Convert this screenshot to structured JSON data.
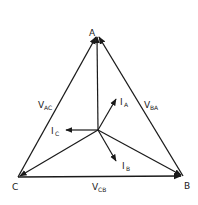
{
  "diagram": {
    "type": "phasor-diagram",
    "colors": {
      "stroke": "#1a1a1a",
      "background": "#ffffff"
    },
    "vertices": [
      {
        "id": "A",
        "label": "A",
        "x": 97,
        "y": 35
      },
      {
        "id": "B",
        "label": "B",
        "x": 183,
        "y": 176
      },
      {
        "id": "C",
        "label": "C",
        "x": 18,
        "y": 177
      }
    ],
    "neutral": {
      "x": 98,
      "y": 130
    },
    "voltages": [
      {
        "id": "VAC",
        "main": "V",
        "sub": "AC",
        "from": "C",
        "to": "A"
      },
      {
        "id": "VBA",
        "main": "V",
        "sub": "BA",
        "from": "B",
        "to": "A"
      },
      {
        "id": "VCB",
        "main": "V",
        "sub": "CB",
        "from": "C",
        "to": "B"
      }
    ],
    "currents": [
      {
        "id": "IA",
        "main": "I",
        "sub": "A"
      },
      {
        "id": "IB",
        "main": "I",
        "sub": "B"
      },
      {
        "id": "IC",
        "main": "I",
        "sub": "C"
      }
    ]
  }
}
